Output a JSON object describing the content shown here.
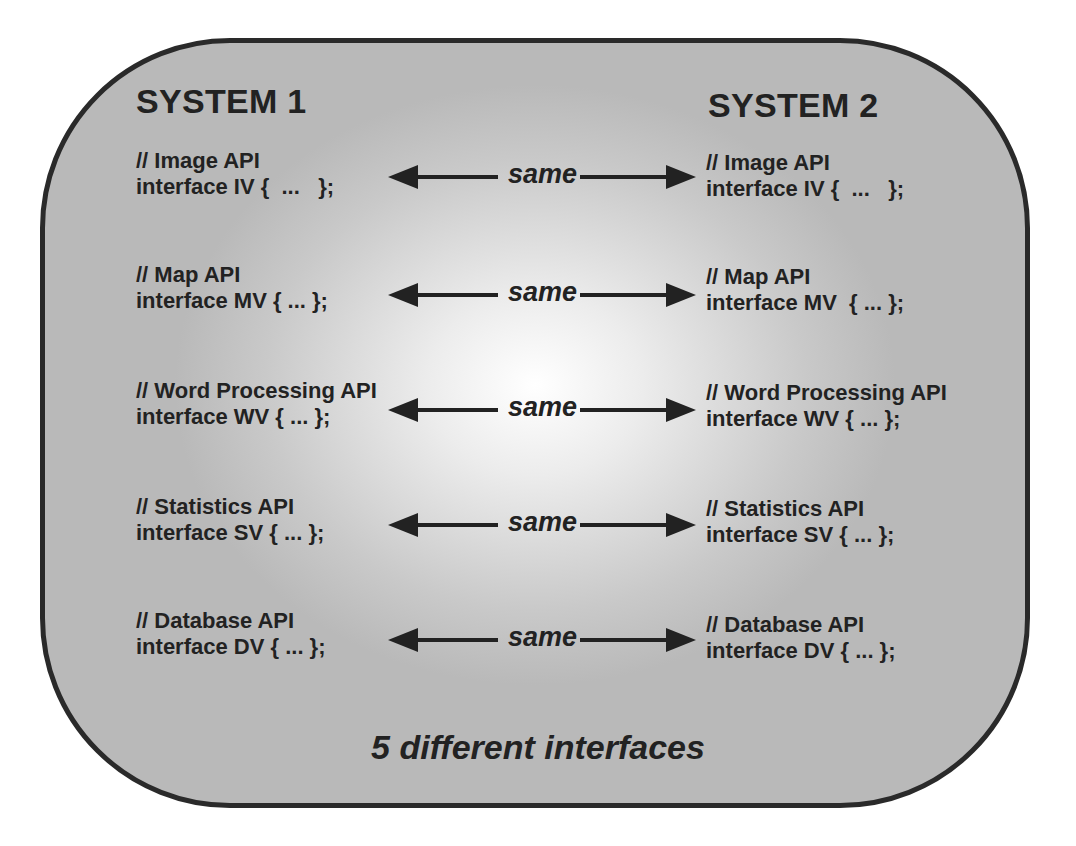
{
  "diagram": {
    "left_heading": "SYSTEM 1",
    "right_heading": "SYSTEM 2",
    "connector_label": "same",
    "rows": [
      {
        "left": {
          "comment": "// Image API",
          "code": "interface IV {  ...   };"
        },
        "right": {
          "comment": "// Image API",
          "code": "interface IV {  ...   };"
        },
        "connector": "same"
      },
      {
        "left": {
          "comment": "// Map API",
          "code": "interface MV { ... };"
        },
        "right": {
          "comment": "// Map API",
          "code": "interface MV  { ... };"
        },
        "connector": "same"
      },
      {
        "left": {
          "comment": "// Word Processing API",
          "code": "interface WV { ... };"
        },
        "right": {
          "comment": "// Word Processing API",
          "code": "interface WV { ... };"
        },
        "connector": "same"
      },
      {
        "left": {
          "comment": "// Statistics API",
          "code": "interface SV { ... };"
        },
        "right": {
          "comment": "// Statistics API",
          "code": "interface SV { ... };"
        },
        "connector": "same"
      },
      {
        "left": {
          "comment": "// Database API",
          "code": "interface DV { ... };"
        },
        "right": {
          "comment": "// Database API",
          "code": "interface DV { ... };"
        },
        "connector": "same"
      }
    ],
    "footer": "5 different interfaces",
    "colors": {
      "panel_border": "#2a2a2a",
      "panel_fill": "#c4c4c4",
      "center_highlight": "#ffffff",
      "text": "#222222"
    }
  }
}
